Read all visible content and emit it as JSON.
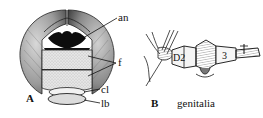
{
  "figure": {
    "panels": [
      {
        "id": "A",
        "letter": "A",
        "subject": "dragonfly head, frontal view",
        "labels": {
          "an": "an",
          "f": "f",
          "cl": "cl",
          "lb": "lb"
        }
      },
      {
        "id": "B",
        "letter": "B",
        "subject": "abdominal segments, lateral view",
        "caption": "genitalia",
        "segment_labels": {
          "s2": "D2",
          "s3": "3"
        }
      }
    ],
    "colors": {
      "ink": "#111111",
      "eye_shade": "#6b6b6b",
      "eye_light": "#cfcfcf",
      "frons_fill": "#e2e2e2",
      "dark_patch": "#0d0d0d",
      "background": "#ffffff"
    }
  }
}
